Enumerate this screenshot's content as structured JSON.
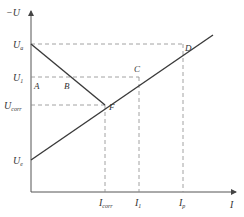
{
  "diagram": {
    "type": "polarization-diagram",
    "axes": {
      "y_label": "−U",
      "x_label": "I"
    },
    "y_ticks": [
      {
        "main": "U",
        "sub": "a"
      },
      {
        "main": "U",
        "sub": "1"
      },
      {
        "main": "U",
        "sub": "corr"
      },
      {
        "main": "U",
        "sub": "e"
      }
    ],
    "x_ticks": [
      {
        "main": "I",
        "sub": "corr"
      },
      {
        "main": "I",
        "sub": "1"
      },
      {
        "main": "I",
        "sub": "p"
      }
    ],
    "points": {
      "A": "A",
      "B": "B",
      "C": "C",
      "D": "D",
      "F": "F"
    },
    "lines": [
      {
        "name": "descending-polarization-line",
        "from": "U_a",
        "to": "F"
      },
      {
        "name": "ascending-polarization-line",
        "from": "U_e",
        "through": [
          "F",
          "C",
          "D"
        ]
      }
    ]
  }
}
